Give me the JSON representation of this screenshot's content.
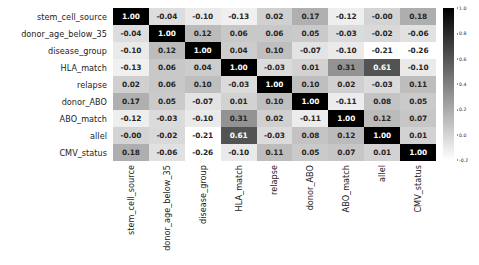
{
  "chart_data": {
    "type": "heatmap",
    "title": "",
    "subtitle": "",
    "xlabel": "",
    "ylabel": "",
    "grid": false,
    "legend_position": "right",
    "colormap": "grayscale-reversed",
    "annotated": true,
    "annotation_format": "0.00",
    "categories": [
      "stem_cell_source",
      "donor_age_below_35",
      "disease_group",
      "HLA_match",
      "relapse",
      "donor_ABO",
      "ABO_match",
      "allel",
      "CMV_status"
    ],
    "x": [
      "stem_cell_source",
      "donor_age_below_35",
      "disease_group",
      "HLA_match",
      "relapse",
      "donor_ABO",
      "ABO_match",
      "allel",
      "CMV_status"
    ],
    "y": [
      "stem_cell_source",
      "donor_age_below_35",
      "disease_group",
      "HLA_match",
      "relapse",
      "donor_ABO",
      "ABO_match",
      "allel",
      "CMV_status"
    ],
    "values": [
      [
        1.0,
        -0.04,
        -0.1,
        -0.13,
        0.02,
        0.17,
        -0.12,
        -0.0,
        0.18
      ],
      [
        -0.04,
        1.0,
        0.12,
        0.06,
        0.06,
        0.05,
        -0.03,
        -0.02,
        -0.06
      ],
      [
        -0.1,
        0.12,
        1.0,
        0.04,
        0.1,
        -0.07,
        -0.1,
        -0.21,
        -0.26
      ],
      [
        -0.13,
        0.06,
        0.04,
        1.0,
        -0.03,
        0.01,
        0.31,
        0.61,
        -0.1
      ],
      [
        0.02,
        0.06,
        0.1,
        -0.03,
        1.0,
        0.1,
        0.02,
        -0.03,
        0.11
      ],
      [
        0.17,
        0.05,
        -0.07,
        0.01,
        0.1,
        1.0,
        -0.11,
        0.08,
        0.05
      ],
      [
        -0.12,
        -0.03,
        -0.1,
        0.31,
        0.02,
        -0.11,
        1.0,
        0.12,
        0.07
      ],
      [
        -0.0,
        -0.02,
        -0.21,
        0.61,
        -0.03,
        0.08,
        0.12,
        1.0,
        0.01
      ],
      [
        0.18,
        -0.06,
        -0.26,
        -0.1,
        0.11,
        0.05,
        0.07,
        0.01,
        1.0
      ]
    ],
    "labels": [
      [
        "1.00",
        "-0.04",
        "-0.10",
        "-0.13",
        "0.02",
        "0.17",
        "-0.12",
        "-0.00",
        "0.18"
      ],
      [
        "-0.04",
        "1.00",
        "0.12",
        "0.06",
        "0.06",
        "0.05",
        "-0.03",
        "-0.02",
        "-0.06"
      ],
      [
        "-0.10",
        "0.12",
        "1.00",
        "0.04",
        "0.10",
        "-0.07",
        "-0.10",
        "-0.21",
        "-0.26"
      ],
      [
        "-0.13",
        "0.06",
        "0.04",
        "1.00",
        "-0.03",
        "0.01",
        "0.31",
        "0.61",
        "-0.10"
      ],
      [
        "0.02",
        "0.06",
        "0.10",
        "-0.03",
        "1.00",
        "0.10",
        "0.02",
        "-0.03",
        "0.11"
      ],
      [
        "0.17",
        "0.05",
        "-0.07",
        "0.01",
        "0.10",
        "1.00",
        "-0.11",
        "0.08",
        "0.05"
      ],
      [
        "-0.12",
        "-0.03",
        "-0.10",
        "0.31",
        "0.02",
        "-0.11",
        "1.00",
        "0.12",
        "0.07"
      ],
      [
        "-0.00",
        "-0.02",
        "-0.21",
        "0.61",
        "-0.03",
        "0.08",
        "0.12",
        "1.00",
        "0.01"
      ],
      [
        "0.18",
        "-0.06",
        "-0.26",
        "-0.10",
        "0.11",
        "0.05",
        "0.07",
        "0.01",
        "1.00"
      ]
    ],
    "colorbar": {
      "vmin": -0.2,
      "vmax": 1.0,
      "ticks": [
        1.0,
        0.8,
        0.6,
        0.4,
        0.2,
        0.0,
        -0.2
      ],
      "tick_labels": [
        "1.0",
        "0.8",
        "0.6",
        "0.4",
        "0.2",
        "0.0",
        "-0.2"
      ],
      "orientation": "vertical"
    }
  },
  "colors": {
    "background": "#ffffff",
    "text": "#1b1b1b",
    "cmap_low": "#ffffff",
    "cmap_high": "#000000"
  }
}
